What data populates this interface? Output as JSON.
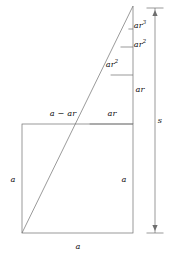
{
  "figure": {
    "labels": {
      "ar_cubed": {
        "base": "ar",
        "exp": "3"
      },
      "ar_squared_right": {
        "base": "ar",
        "exp": "2"
      },
      "ar_squared_inner": {
        "base": "ar",
        "exp": "2"
      },
      "ar": {
        "base": "ar",
        "exp": ""
      },
      "a_minus_ar": "a − ar",
      "ar_top_band": "ar",
      "a_left": "a",
      "a_right": "a",
      "a_bottom": "a",
      "s": "s"
    },
    "colors": {
      "stroke": "#6e6e6e",
      "text": "#111111",
      "background": "#ffffff"
    },
    "geometry": {
      "square": {
        "x": 22,
        "y": 124,
        "width": 111,
        "height": 109
      },
      "apex": {
        "x": 133,
        "y": 6
      },
      "diagonal_start": {
        "x": 22,
        "y": 233
      },
      "right_column_x": 133,
      "dividers_y": [
        29,
        47,
        75,
        124
      ],
      "bracket_x": 155,
      "bracket_top_y": 8,
      "bracket_bottom_y": 233
    }
  }
}
